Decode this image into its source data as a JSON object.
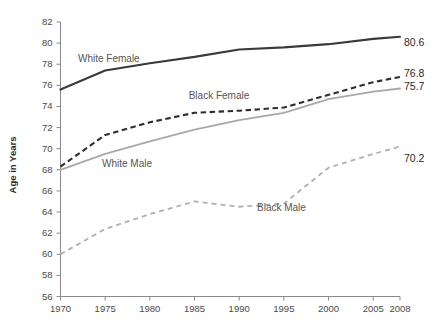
{
  "chart_data": {
    "type": "line",
    "title": "",
    "xlabel": "",
    "ylabel": "Age in Years",
    "xlim": [
      1970,
      2008
    ],
    "ylim": [
      56,
      82
    ],
    "grid": false,
    "legend_position": "inline-labels",
    "x": [
      1970,
      1975,
      1980,
      1985,
      1990,
      1995,
      2000,
      2005,
      2008
    ],
    "xtick_labels": [
      "1970",
      "1975",
      "1980",
      "1985",
      "1990",
      "1995",
      "2000",
      "2005",
      "2008"
    ],
    "ytick_labels": [
      "56",
      "58",
      "60",
      "62",
      "64",
      "66",
      "68",
      "70",
      "72",
      "74",
      "76",
      "78",
      "80",
      "82"
    ],
    "ytick_values": [
      56,
      58,
      60,
      62,
      64,
      66,
      68,
      70,
      72,
      74,
      76,
      78,
      80,
      82
    ],
    "series": [
      {
        "name": "White Female",
        "style": "solid",
        "color": "#3a3a3a",
        "label": "White Female",
        "end_label": "80.6",
        "values": [
          75.6,
          77.4,
          78.1,
          78.7,
          79.4,
          79.6,
          79.9,
          80.4,
          80.6
        ]
      },
      {
        "name": "Black Female",
        "style": "dashed",
        "color": "#2e2e2e",
        "label": "Black Female",
        "end_label": "76.8",
        "values": [
          68.3,
          71.3,
          72.5,
          73.4,
          73.6,
          73.9,
          75.1,
          76.3,
          76.8
        ]
      },
      {
        "name": "White Male",
        "style": "solid",
        "color": "#a8a8a8",
        "label": "White Male",
        "end_label": "75.7",
        "values": [
          68.0,
          69.5,
          70.7,
          71.8,
          72.7,
          73.4,
          74.7,
          75.4,
          75.7
        ]
      },
      {
        "name": "Black Male",
        "style": "dashed",
        "color": "#b0b0b0",
        "label": "Black Male",
        "end_label": "70.2",
        "values": [
          60.0,
          62.4,
          63.8,
          65.0,
          64.5,
          64.8,
          68.2,
          69.5,
          70.2
        ]
      }
    ]
  },
  "labels": {
    "white_female": "White Female",
    "black_female": "Black Female",
    "white_male": "White Male",
    "black_male": "Black Male",
    "end_white_female": "80.6",
    "end_black_female": "76.8",
    "end_white_male": "75.7",
    "end_black_male": "70.2",
    "y_axis_title": "Age in Years"
  }
}
